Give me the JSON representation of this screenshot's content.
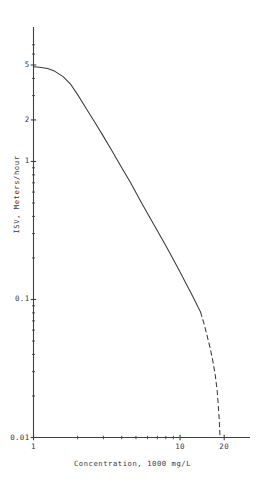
{
  "chart_data": {
    "type": "line",
    "title": "",
    "xlabel": "Concentration, 1000 mg/L",
    "ylabel": "ISV, Meters/hour",
    "xscale": "log",
    "yscale": "log",
    "xlim": [
      1,
      30
    ],
    "ylim": [
      0.01,
      8
    ],
    "grid": false,
    "legend": null,
    "xticks": [
      {
        "value": 1,
        "label": "1",
        "major": true
      },
      {
        "value": 2,
        "label": "",
        "major": false
      },
      {
        "value": 3,
        "label": "",
        "major": false
      },
      {
        "value": 4,
        "label": "",
        "major": false
      },
      {
        "value": 5,
        "label": "",
        "major": false
      },
      {
        "value": 6,
        "label": "",
        "major": false
      },
      {
        "value": 7,
        "label": "",
        "major": false
      },
      {
        "value": 8,
        "label": "",
        "major": false
      },
      {
        "value": 9,
        "label": "",
        "major": false
      },
      {
        "value": 10,
        "label": "10",
        "major": true
      },
      {
        "value": 20,
        "label": "20",
        "major": true
      }
    ],
    "yticks": [
      {
        "value": 5,
        "label": "5",
        "major": true
      },
      {
        "value": 4,
        "label": "",
        "major": false
      },
      {
        "value": 3,
        "label": "",
        "major": false
      },
      {
        "value": 2,
        "label": "2",
        "major": true
      },
      {
        "value": 1,
        "label": "1",
        "major": true
      },
      {
        "value": 0.9,
        "label": "",
        "major": false
      },
      {
        "value": 0.8,
        "label": "",
        "major": false
      },
      {
        "value": 0.7,
        "label": "",
        "major": false
      },
      {
        "value": 0.6,
        "label": "",
        "major": false
      },
      {
        "value": 0.5,
        "label": "",
        "major": false
      },
      {
        "value": 0.4,
        "label": "",
        "major": false
      },
      {
        "value": 0.3,
        "label": "",
        "major": false
      },
      {
        "value": 0.2,
        "label": "",
        "major": false
      },
      {
        "value": 0.1,
        "label": "0.1",
        "major": true
      },
      {
        "value": 0.09,
        "label": "",
        "major": false
      },
      {
        "value": 0.08,
        "label": "",
        "major": false
      },
      {
        "value": 0.07,
        "label": "",
        "major": false
      },
      {
        "value": 0.06,
        "label": "",
        "major": false
      },
      {
        "value": 0.05,
        "label": "",
        "major": false
      },
      {
        "value": 0.04,
        "label": "",
        "major": false
      },
      {
        "value": 0.03,
        "label": "",
        "major": false
      },
      {
        "value": 0.02,
        "label": "",
        "major": false
      },
      {
        "value": 0.01,
        "label": "0.01",
        "major": true
      }
    ],
    "series": [
      {
        "name": "ISV curve (measured)",
        "style": "solid",
        "color": "#3a3a3a",
        "points": [
          [
            1.0,
            4.85
          ],
          [
            1.1,
            4.82
          ],
          [
            1.25,
            4.72
          ],
          [
            1.4,
            4.5
          ],
          [
            1.6,
            4.1
          ],
          [
            1.8,
            3.6
          ],
          [
            2.0,
            3.05
          ],
          [
            2.3,
            2.4
          ],
          [
            2.6,
            1.95
          ],
          [
            3.0,
            1.52
          ],
          [
            3.5,
            1.15
          ],
          [
            4.0,
            0.9
          ],
          [
            4.6,
            0.7
          ],
          [
            5.3,
            0.53
          ],
          [
            6.0,
            0.42
          ],
          [
            7.0,
            0.315
          ],
          [
            8.0,
            0.245
          ],
          [
            9.0,
            0.195
          ],
          [
            10.0,
            0.158
          ],
          [
            11.0,
            0.13
          ],
          [
            12.0,
            0.109
          ],
          [
            13.0,
            0.092
          ],
          [
            13.8,
            0.081
          ]
        ]
      },
      {
        "name": "ISV curve (extrapolated)",
        "style": "dashed",
        "color": "#3a3a3a",
        "points": [
          [
            13.8,
            0.081
          ],
          [
            14.5,
            0.068
          ],
          [
            15.2,
            0.056
          ],
          [
            16.0,
            0.045
          ],
          [
            16.8,
            0.035
          ],
          [
            17.4,
            0.028
          ],
          [
            17.9,
            0.022
          ],
          [
            18.2,
            0.0175
          ],
          [
            18.5,
            0.0135
          ],
          [
            18.7,
            0.0105
          ],
          [
            18.8,
            0.01
          ]
        ]
      }
    ]
  },
  "axis_titles": {
    "x": "Concentration, 1000 mg/L",
    "y": "ISV, Meters/hour"
  }
}
